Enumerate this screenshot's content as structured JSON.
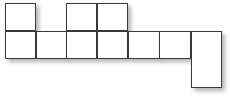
{
  "figure": {
    "type": "polyomino-grid",
    "canvas": {
      "width": 230,
      "height": 104,
      "background_color": "#ffffff"
    },
    "style": {
      "cell_fill": "#ffffff",
      "cell_border_color": "#3a3a3a",
      "cell_border_width": 1,
      "shadow_color": "#5a5a5a",
      "shadow_offset_x": 3,
      "shadow_offset_y": 3,
      "shadow_blur": 4
    },
    "grid": {
      "cell_width": 30.5,
      "cell_height": 28,
      "columns": 7,
      "rows": 3,
      "column_x": [
        5,
        35.5,
        66,
        96.5,
        127.5,
        159,
        191
      ],
      "row_y": [
        2.5,
        30.5,
        59
      ]
    },
    "cell_count": 9,
    "cells": [
      {
        "id": "r1c1",
        "row": 1,
        "col": 1,
        "x": 5,
        "y": 2.5,
        "width": 31,
        "height": 28.5,
        "label": ""
      },
      {
        "id": "r1c3",
        "row": 1,
        "col": 3,
        "x": 66,
        "y": 2.5,
        "width": 31,
        "height": 28.5,
        "label": ""
      },
      {
        "id": "r1c4",
        "row": 1,
        "col": 4,
        "x": 96.5,
        "y": 2.5,
        "width": 31.5,
        "height": 28.5,
        "label": ""
      },
      {
        "id": "r2c1",
        "row": 2,
        "col": 1,
        "x": 5,
        "y": 30.5,
        "width": 31,
        "height": 28.5,
        "label": ""
      },
      {
        "id": "r2c2",
        "row": 2,
        "col": 2,
        "x": 35.5,
        "y": 30.5,
        "width": 31,
        "height": 28.5,
        "label": ""
      },
      {
        "id": "r2c3",
        "row": 2,
        "col": 3,
        "x": 66,
        "y": 30.5,
        "width": 31,
        "height": 28.5,
        "label": ""
      },
      {
        "id": "r2c4",
        "row": 2,
        "col": 4,
        "x": 96.5,
        "y": 30.5,
        "width": 31.5,
        "height": 28.5,
        "label": ""
      },
      {
        "id": "r2c5",
        "row": 2,
        "col": 5,
        "x": 127.5,
        "y": 30.5,
        "width": 32,
        "height": 28.5,
        "label": ""
      },
      {
        "id": "r2c6",
        "row": 2,
        "col": 6,
        "x": 159,
        "y": 30.5,
        "width": 32,
        "height": 28.5,
        "label": ""
      },
      {
        "id": "r2c7",
        "row": 2,
        "col": 7,
        "x": 191,
        "y": 30.5,
        "width": 31,
        "height": 57.5,
        "label": ""
      }
    ]
  }
}
